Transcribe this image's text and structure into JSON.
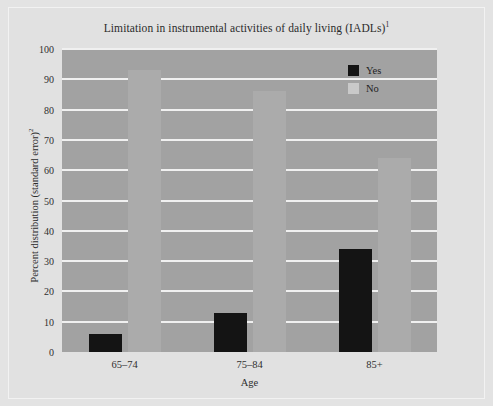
{
  "chart_data": {
    "type": "bar",
    "title": "Limitation in instrumental activities of daily living (IADLs)",
    "title_superscript": "1",
    "xlabel": "Age",
    "ylabel": "Percent distribution (standard error)",
    "ylabel_superscript": "2",
    "categories": [
      "65–74",
      "75–84",
      "85+"
    ],
    "series": [
      {
        "name": "Yes",
        "color": "#141414",
        "values": [
          6,
          13,
          34
        ]
      },
      {
        "name": "No",
        "color": "#ababab",
        "values": [
          93,
          86,
          64
        ]
      }
    ],
    "ylim": [
      0,
      100
    ],
    "ytick_labels": [
      "0",
      "10",
      "20",
      "30",
      "40",
      "50",
      "60",
      "70",
      "80",
      "90",
      "100"
    ],
    "ytick_values": [
      0,
      10,
      20,
      30,
      40,
      50,
      60,
      70,
      80,
      90,
      100
    ],
    "grid": true,
    "legend_position": "top-right",
    "colors": {
      "figure_background": "#e1e1e1",
      "plot_background": "#a2a2a2",
      "gridline": "#f0f0f0",
      "text": "#2b2b2b"
    }
  }
}
